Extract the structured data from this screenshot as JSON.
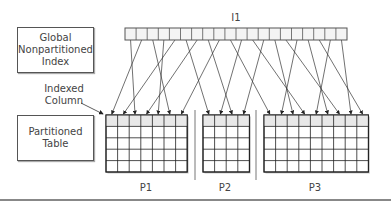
{
  "diagram": {
    "index_label": "I1",
    "global_index_box": [
      "Global",
      "Nonpartitioned",
      "Index"
    ],
    "indexed_column_label": [
      "Indexed",
      "Column"
    ],
    "partitioned_table_box": [
      "Partitioned",
      "Table"
    ],
    "index_entries": 20,
    "partitions": [
      {
        "name": "P1",
        "columns": 7,
        "rows": 5
      },
      {
        "name": "P2",
        "columns": 4,
        "rows": 5
      },
      {
        "name": "P3",
        "columns": 9,
        "rows": 5
      }
    ],
    "colors": {
      "line": "#333333",
      "header_row": "#e8e8e8",
      "border": "#555555"
    }
  }
}
